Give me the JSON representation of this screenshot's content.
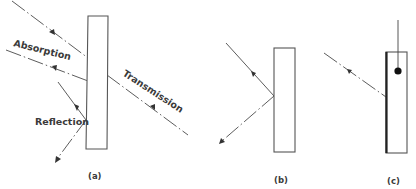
{
  "diagram": {
    "panels": [
      {
        "id": "a",
        "caption": "(a)",
        "labels": {
          "absorption": "Absorption",
          "transmission": "Transmission",
          "reflection": "Reflection"
        }
      },
      {
        "id": "b",
        "caption": "(b)"
      },
      {
        "id": "c",
        "caption": "(c)"
      }
    ],
    "colors": {
      "line": "#4a4a4a",
      "slab_border": "#555555",
      "text": "#3a3a3a",
      "background": "#ffffff"
    }
  }
}
